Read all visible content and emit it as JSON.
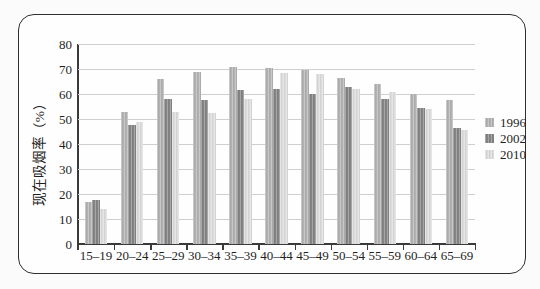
{
  "figure": {
    "background": "#fefefe",
    "border_color": "#2f2f2f",
    "page_background": "#fbfbfb"
  },
  "colors": {
    "axis": "#3a3a3a",
    "gridline": "#cfcfcf",
    "text": "#1f1f1f"
  },
  "chart_data": {
    "type": "bar",
    "title": "",
    "xlabel": "",
    "ylabel": "现在吸烟率（%）",
    "ylim": [
      0,
      80
    ],
    "ytick_step": 10,
    "grid": true,
    "legend_position": "right",
    "categories": [
      "15–19",
      "20–24",
      "25–29",
      "30–34",
      "35–39",
      "40–44",
      "45–49",
      "50–54",
      "55–59",
      "60–64",
      "65–69"
    ],
    "series": [
      {
        "name": "1996",
        "color": "#b2b2b2",
        "values": [
          17,
          53,
          66,
          69,
          71,
          70.5,
          69.5,
          66.5,
          64,
          60,
          57.5
        ]
      },
      {
        "name": "2002",
        "color": "#848484",
        "values": [
          17.5,
          47.5,
          58,
          57.5,
          61.5,
          62,
          60,
          63,
          58,
          54.5,
          46.5
        ]
      },
      {
        "name": "2010",
        "color": "#dcdcdc",
        "values": [
          14,
          49,
          53,
          52.5,
          58,
          68.5,
          68,
          62,
          61,
          54,
          45.5
        ]
      }
    ]
  }
}
